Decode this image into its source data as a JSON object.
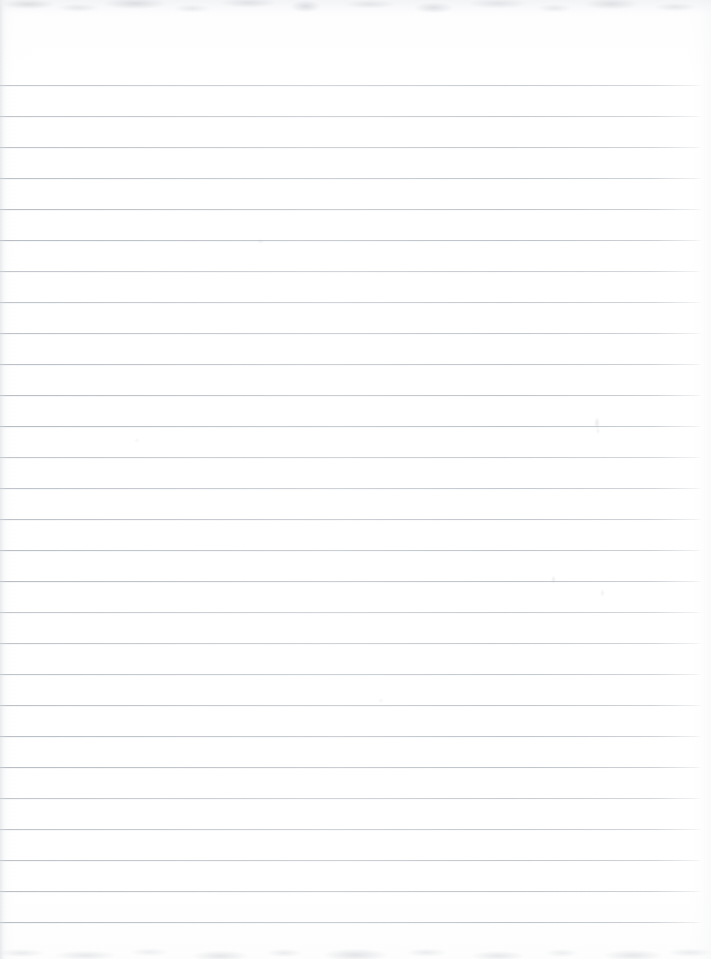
{
  "document": {
    "kind": "scanned-lined-notebook-page",
    "title": "Blank Ruled Notebook Page",
    "content_text": "",
    "width_px": 711,
    "height_px": 959
  },
  "paper": {
    "background_color": "#ffffff",
    "tint_color": "#fdfdfe",
    "left_margin_px": 0,
    "right_margin_px": 9
  },
  "ruling": {
    "line_color": "#b7bcc3",
    "line_thickness_px": 1,
    "line_spacing_px": 31,
    "first_line_y_px": 85,
    "line_count": 28,
    "line_start_x_px": 0,
    "line_end_x_px": 702,
    "line_y_positions": [
      85,
      116,
      147,
      178,
      209,
      240,
      271,
      302,
      333,
      364,
      395,
      426,
      457,
      488,
      519,
      550,
      581,
      612,
      643,
      674,
      705,
      736,
      767,
      798,
      829,
      860,
      891,
      922
    ]
  },
  "scan_artifacts": {
    "top_band": {
      "y_px": 0,
      "height_px": 14,
      "color": "#c8cbcf",
      "description": "mottled grey scan edge"
    },
    "bottom_band": {
      "y_px": 939,
      "height_px": 20,
      "color": "#ccd0d4",
      "description": "mottled grey scan edge"
    },
    "smudges": [
      {
        "x_px": 594,
        "y_px": 417,
        "w_px": 6,
        "h_px": 12,
        "opacity": 0.22
      },
      {
        "x_px": 596,
        "y_px": 428,
        "w_px": 4,
        "h_px": 6,
        "opacity": 0.16
      },
      {
        "x_px": 551,
        "y_px": 575,
        "w_px": 5,
        "h_px": 9,
        "opacity": 0.18
      },
      {
        "x_px": 600,
        "y_px": 589,
        "w_px": 5,
        "h_px": 8,
        "opacity": 0.15
      },
      {
        "x_px": 257,
        "y_px": 239,
        "w_px": 7,
        "h_px": 5,
        "opacity": 0.12
      },
      {
        "x_px": 134,
        "y_px": 438,
        "w_px": 6,
        "h_px": 5,
        "opacity": 0.1
      },
      {
        "x_px": 378,
        "y_px": 698,
        "w_px": 6,
        "h_px": 5,
        "opacity": 0.1
      }
    ]
  }
}
